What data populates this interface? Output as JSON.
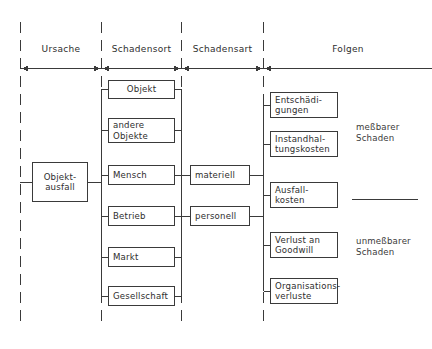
{
  "diagram": {
    "headers": [
      {
        "label": "Ursache"
      },
      {
        "label": "Schadensort"
      },
      {
        "label": "Schadensart"
      },
      {
        "label": "Folgen"
      }
    ],
    "cause": {
      "label": "Objekt-\nausfall"
    },
    "locations": [
      {
        "label": "Objekt"
      },
      {
        "label": "andere\nObjekte"
      },
      {
        "label": "Mensch"
      },
      {
        "label": "Betrieb"
      },
      {
        "label": "Markt"
      },
      {
        "label": "Gesellschaft"
      }
    ],
    "damage_types": [
      {
        "label": "materiell"
      },
      {
        "label": "personell"
      }
    ],
    "consequences": [
      {
        "label": "Entschädi-\ngungen"
      },
      {
        "label": "Instandhal-\ntungskosten"
      },
      {
        "label": "Ausfall-\nkosten"
      },
      {
        "label": "Verlust an\nGoodwill"
      },
      {
        "label": "Organisations-\nverluste"
      }
    ],
    "groups": [
      {
        "label": "meßbarer\nSchaden"
      },
      {
        "label": "unmeßbarer\nSchaden"
      }
    ],
    "colors": {
      "stroke": "#3a3a3a",
      "text": "#2e2e2e",
      "background": "#ffffff"
    }
  }
}
